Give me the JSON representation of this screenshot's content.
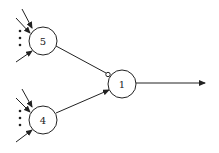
{
  "diagram": {
    "type": "neural-network",
    "nodes": [
      {
        "id": "5",
        "label": "5",
        "cx": 43,
        "cy": 41,
        "r": 14
      },
      {
        "id": "4",
        "label": "4",
        "cx": 43,
        "cy": 120,
        "r": 14
      },
      {
        "id": "1",
        "label": "1",
        "cx": 122,
        "cy": 84,
        "r": 14
      }
    ],
    "edges": [
      {
        "from": "5",
        "to": "1",
        "type": "inhibitory"
      },
      {
        "from": "4",
        "to": "1",
        "type": "excitatory"
      },
      {
        "from": "1",
        "to": "output",
        "type": "excitatory"
      }
    ],
    "inputs": [
      {
        "to": "5",
        "count_visible": 3,
        "ellipsis": true
      },
      {
        "to": "4",
        "count_visible": 3,
        "ellipsis": true
      }
    ],
    "colors": {
      "stroke": "#222222",
      "background": "#ffffff"
    }
  }
}
